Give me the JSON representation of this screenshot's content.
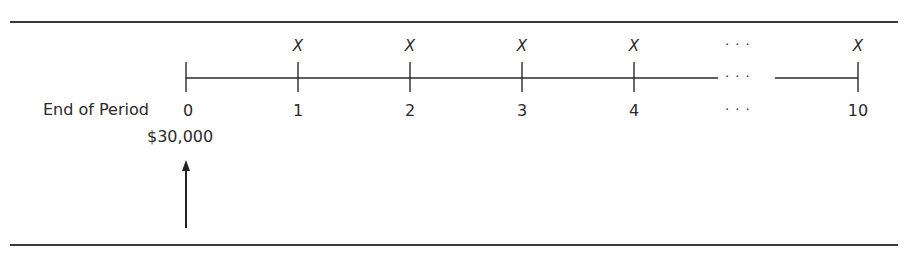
{
  "diagram": {
    "row_label": "End of Period",
    "present_value": "$30,000",
    "periods": [
      {
        "label": "0",
        "x": 186,
        "payment": ""
      },
      {
        "label": "1",
        "x": 298,
        "payment": "X"
      },
      {
        "label": "2",
        "x": 410,
        "payment": "X"
      },
      {
        "label": "3",
        "x": 522,
        "payment": "X"
      },
      {
        "label": "4",
        "x": 634,
        "payment": "X"
      },
      {
        "label": "10",
        "x": 858,
        "payment": "X"
      }
    ],
    "ellipsis": "· · ·",
    "ellipsis_x": 745
  }
}
